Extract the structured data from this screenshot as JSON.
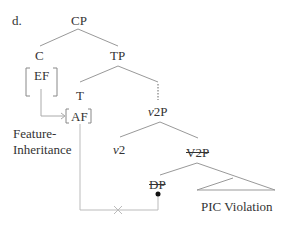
{
  "diagram": {
    "label": "d.",
    "nodes": {
      "cp": "CP",
      "c": "C",
      "ef": "EF",
      "tp": "TP",
      "t": "T",
      "af": "AF",
      "v2p_italic": "v",
      "v2p_rest": "2P",
      "v2_italic": "v",
      "v2_rest": "2",
      "V2P": "V2P",
      "dp": "DP"
    },
    "annotations": {
      "feature_inheritance_line1": "Feature-",
      "feature_inheritance_line2": "Inheritance",
      "pic_violation": "PIC Violation"
    }
  }
}
